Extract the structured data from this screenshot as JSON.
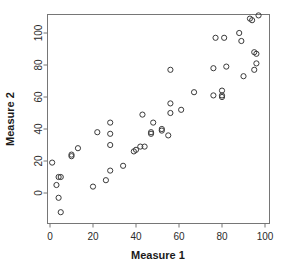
{
  "chart_data": {
    "type": "scatter",
    "title": "",
    "xlabel": "Measure 1",
    "ylabel": "Measure 2",
    "xlim": [
      -3,
      102
    ],
    "ylim": [
      -17,
      115
    ],
    "xticks": [
      0,
      20,
      40,
      60,
      80,
      100
    ],
    "yticks": [
      0,
      20,
      40,
      60,
      80,
      100
    ],
    "xtick_labels": [
      "0",
      "20",
      "40",
      "60",
      "80",
      "100"
    ],
    "ytick_labels": [
      "0",
      "20",
      "40",
      "60",
      "80",
      "100"
    ],
    "grid": false,
    "legend": null,
    "marker": "open-circle",
    "marker_color": "#3a3a3a",
    "n_points": 60,
    "points": [
      [
        1,
        19
      ],
      [
        3,
        5
      ],
      [
        4,
        10
      ],
      [
        5,
        10
      ],
      [
        4,
        -3
      ],
      [
        5,
        -12
      ],
      [
        10,
        23
      ],
      [
        10,
        24
      ],
      [
        13,
        28
      ],
      [
        20,
        4
      ],
      [
        22,
        38
      ],
      [
        26,
        8
      ],
      [
        28,
        30
      ],
      [
        28,
        37
      ],
      [
        28,
        44
      ],
      [
        28,
        14
      ],
      [
        34,
        17
      ],
      [
        39,
        26
      ],
      [
        40,
        27
      ],
      [
        42,
        29
      ],
      [
        43,
        49
      ],
      [
        44,
        29
      ],
      [
        47,
        38
      ],
      [
        47,
        37
      ],
      [
        48,
        44
      ],
      [
        52,
        39
      ],
      [
        52,
        40
      ],
      [
        55,
        36
      ],
      [
        56,
        50
      ],
      [
        56,
        56
      ],
      [
        56,
        77
      ],
      [
        61,
        52
      ],
      [
        67,
        63
      ],
      [
        76,
        61
      ],
      [
        76,
        78
      ],
      [
        77,
        97
      ],
      [
        80,
        64
      ],
      [
        80,
        61
      ],
      [
        80,
        60
      ],
      [
        81,
        97
      ],
      [
        82,
        79
      ],
      [
        88,
        100
      ],
      [
        89,
        95
      ],
      [
        90,
        73
      ],
      [
        93,
        109
      ],
      [
        94,
        108
      ],
      [
        95,
        77
      ],
      [
        95,
        88
      ],
      [
        96,
        87
      ],
      [
        96,
        81
      ],
      [
        97,
        111
      ]
    ]
  },
  "axes": {
    "x_title": "Measure 1",
    "y_title": "Measure 2"
  }
}
